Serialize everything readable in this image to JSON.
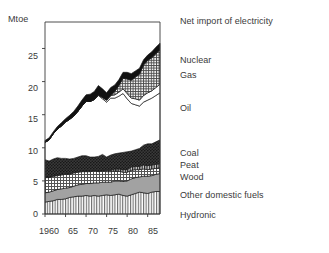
{
  "chart_data": {
    "type": "area",
    "title": "",
    "subtitle": "",
    "xlabel": "",
    "ylabel": "Mtoe",
    "ylim": [
      0,
      29
    ],
    "xlim": [
      1960,
      1988
    ],
    "grid": false,
    "legend_position": "right",
    "stacking": "stacked",
    "x": [
      1960,
      1961,
      1962,
      1963,
      1964,
      1965,
      1966,
      1967,
      1968,
      1969,
      1970,
      1971,
      1972,
      1973,
      1974,
      1975,
      1976,
      1977,
      1978,
      1979,
      1980,
      1981,
      1982,
      1983,
      1984,
      1985,
      1986,
      1987,
      1988
    ],
    "y_ticks": [
      0,
      5,
      10,
      15,
      20,
      25
    ],
    "y_tick_labels": [
      "0",
      "5",
      "10",
      "15",
      "20",
      "25"
    ],
    "x_ticks": [
      1960,
      1965,
      1970,
      1975,
      1980,
      1985
    ],
    "x_tick_labels": [
      "1960",
      "65",
      "70",
      "75",
      "80",
      "85"
    ],
    "series": [
      {
        "name": "Hydronic",
        "fill": "vertical-lines",
        "values": [
          1.8,
          1.9,
          2.0,
          2.2,
          2.2,
          2.3,
          2.5,
          2.6,
          2.7,
          2.7,
          2.8,
          2.7,
          2.8,
          2.7,
          2.8,
          2.9,
          2.8,
          2.9,
          3.0,
          2.8,
          2.7,
          2.9,
          3.1,
          3.3,
          3.2,
          3.1,
          3.3,
          3.4,
          3.4
        ]
      },
      {
        "name": "Other domestic fuels",
        "fill": "solid-gray",
        "values": [
          1.4,
          1.4,
          1.5,
          1.5,
          1.6,
          1.6,
          1.5,
          1.6,
          1.7,
          1.8,
          1.8,
          1.9,
          1.9,
          2.0,
          2.0,
          1.9,
          2.0,
          2.1,
          2.0,
          2.1,
          2.3,
          2.4,
          2.4,
          2.3,
          2.5,
          2.6,
          2.5,
          2.6,
          2.7
        ]
      },
      {
        "name": "Wood",
        "fill": "grid-hatch",
        "values": [
          2.3,
          2.2,
          2.2,
          2.1,
          2.1,
          2.1,
          2.0,
          2.0,
          1.9,
          1.9,
          1.8,
          1.8,
          1.8,
          1.7,
          1.7,
          1.6,
          1.6,
          1.5,
          1.5,
          1.4,
          1.3,
          1.3,
          1.2,
          1.1,
          1.1,
          1.0,
          1.0,
          0.9,
          0.9
        ]
      },
      {
        "name": "Peat",
        "fill": "dark-stripe",
        "values": [
          0.1,
          0.1,
          0.1,
          0.1,
          0.1,
          0.1,
          0.1,
          0.1,
          0.1,
          0.1,
          0.1,
          0.1,
          0.1,
          0.1,
          0.1,
          0.2,
          0.2,
          0.3,
          0.3,
          0.4,
          0.4,
          0.5,
          0.5,
          0.5,
          0.6,
          0.6,
          0.6,
          0.6,
          0.6
        ]
      },
      {
        "name": "Coal",
        "fill": "dark-texture",
        "values": [
          2.6,
          2.4,
          2.5,
          2.6,
          2.4,
          2.3,
          2.2,
          2.1,
          2.2,
          2.3,
          2.3,
          2.1,
          2.0,
          2.2,
          2.4,
          2.0,
          2.3,
          2.3,
          2.4,
          2.6,
          2.7,
          2.4,
          2.5,
          2.7,
          3.0,
          3.3,
          3.2,
          3.4,
          3.6
        ]
      },
      {
        "name": "Oil",
        "fill": "white",
        "values": [
          2.6,
          3.2,
          3.8,
          4.3,
          4.9,
          5.5,
          6.0,
          6.4,
          6.9,
          7.5,
          8.2,
          8.4,
          8.7,
          9.2,
          8.4,
          8.3,
          8.6,
          8.4,
          8.6,
          8.9,
          8.0,
          7.2,
          6.8,
          6.4,
          6.5,
          6.6,
          6.9,
          7.0,
          7.1
        ]
      },
      {
        "name": "Gas",
        "fill": "white-outline",
        "values": [
          0.0,
          0.0,
          0.0,
          0.0,
          0.0,
          0.0,
          0.0,
          0.0,
          0.0,
          0.0,
          0.0,
          0.0,
          0.0,
          0.1,
          0.2,
          0.3,
          0.4,
          0.5,
          0.6,
          0.7,
          0.8,
          0.8,
          0.9,
          0.9,
          1.0,
          1.1,
          1.1,
          1.2,
          1.3
        ]
      },
      {
        "name": "Nuclear",
        "fill": "fine-grid",
        "values": [
          0.0,
          0.0,
          0.0,
          0.0,
          0.0,
          0.0,
          0.0,
          0.0,
          0.0,
          0.0,
          0.0,
          0.0,
          0.0,
          0.0,
          0.0,
          0.0,
          0.0,
          0.5,
          1.0,
          1.6,
          2.2,
          2.7,
          3.3,
          3.9,
          4.6,
          4.9,
          5.0,
          5.1,
          5.2
        ]
      },
      {
        "name": "Net import of electricity",
        "fill": "black",
        "values": [
          0.3,
          0.3,
          0.3,
          0.4,
          0.5,
          0.5,
          0.6,
          0.7,
          0.8,
          0.9,
          1.0,
          1.1,
          1.2,
          1.4,
          1.3,
          1.1,
          1.2,
          1.0,
          0.9,
          0.9,
          1.0,
          1.0,
          0.9,
          0.9,
          0.8,
          0.8,
          0.9,
          1.0,
          1.0
        ]
      }
    ],
    "totals": [
      11.1,
      11.5,
      12.4,
      13.2,
      13.8,
      14.4,
      14.9,
      15.5,
      16.3,
      17.2,
      18.0,
      18.1,
      18.5,
      19.4,
      18.9,
      18.3,
      19.1,
      19.5,
      20.3,
      21.4,
      21.4,
      21.2,
      21.6,
      22.0,
      23.3,
      24.0,
      24.5,
      25.2,
      25.8
    ]
  },
  "legend": {
    "entries": [
      {
        "label": "Net import of electricity"
      },
      {
        "label": "Nuclear"
      },
      {
        "label": "Gas"
      },
      {
        "label": "Oil"
      },
      {
        "label": "Coal"
      },
      {
        "label": "Peat"
      },
      {
        "label": "Wood"
      },
      {
        "label": "Other domestic fuels"
      },
      {
        "label": "Hydronic"
      }
    ]
  },
  "colors": {
    "axis": "#3a3a3a",
    "text": "#3a3a3a",
    "black": "#111111",
    "dark_texture": "#2e2e2e",
    "gray": "#9a9a9a",
    "light": "#ffffff"
  }
}
